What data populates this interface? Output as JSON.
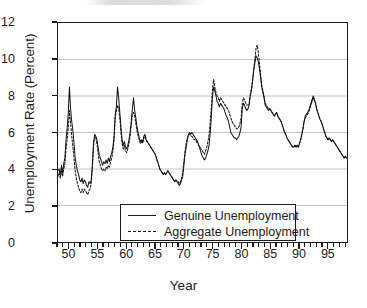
{
  "chart_data": {
    "type": "line",
    "title": "",
    "xlabel": "Year",
    "ylabel": "Unemployment Rate (Percent)",
    "xlim": [
      1948.0,
      1998.5
    ],
    "ylim": [
      0,
      12
    ],
    "yticks": [
      0,
      2,
      4,
      6,
      8,
      10,
      12
    ],
    "ytick_labels": [
      "0",
      "2",
      "4",
      "6",
      "8",
      "10",
      "12"
    ],
    "xticks": [
      1950,
      1955,
      1960,
      1965,
      1970,
      1975,
      1980,
      1985,
      1990,
      1995
    ],
    "xtick_labels": [
      "50",
      "55",
      "60",
      "65",
      "70",
      "75",
      "80",
      "85",
      "90",
      "95"
    ],
    "minor_xtick_interval": 1,
    "grid": "horizontal-major",
    "grid_color": "#b4b4b4",
    "axis_color": "#1a1a1a",
    "legend_position": "lower-center",
    "legend_entries": [
      "Genuine Unemployment",
      "Aggregate Unemployment"
    ],
    "series": [
      {
        "name": "Genuine Unemployment",
        "style": "solid",
        "color": "#111111",
        "x": [
          1948.0,
          1948.2,
          1948.4,
          1948.6,
          1948.8,
          1949.0,
          1949.2,
          1949.4,
          1949.6,
          1949.8,
          1950.0,
          1950.2,
          1950.4,
          1950.6,
          1950.8,
          1951.0,
          1951.2,
          1951.4,
          1951.6,
          1951.8,
          1952.0,
          1952.2,
          1952.4,
          1952.6,
          1952.8,
          1953.0,
          1953.2,
          1953.4,
          1953.6,
          1953.8,
          1954.0,
          1954.2,
          1954.4,
          1954.6,
          1954.8,
          1955.0,
          1955.2,
          1955.4,
          1955.6,
          1955.8,
          1956.0,
          1956.2,
          1956.4,
          1956.6,
          1956.8,
          1957.0,
          1957.2,
          1957.4,
          1957.6,
          1957.8,
          1958.0,
          1958.2,
          1958.4,
          1958.6,
          1958.8,
          1959.0,
          1959.2,
          1959.4,
          1959.6,
          1959.8,
          1960.0,
          1960.2,
          1960.4,
          1960.6,
          1960.8,
          1961.0,
          1961.2,
          1961.4,
          1961.6,
          1961.8,
          1962.0,
          1962.2,
          1962.4,
          1962.6,
          1962.8,
          1963.0,
          1963.2,
          1963.4,
          1963.6,
          1963.8,
          1964.0,
          1964.2,
          1964.4,
          1964.6,
          1964.8,
          1965.0,
          1965.2,
          1965.4,
          1965.6,
          1965.8,
          1966.0,
          1966.2,
          1966.4,
          1966.6,
          1966.8,
          1967.0,
          1967.2,
          1967.4,
          1967.6,
          1967.8,
          1968.0,
          1968.2,
          1968.4,
          1968.6,
          1968.8,
          1969.0,
          1969.2,
          1969.4,
          1969.6,
          1969.8,
          1970.0,
          1970.2,
          1970.4,
          1970.6,
          1970.8,
          1971.0,
          1971.2,
          1971.4,
          1971.6,
          1971.8,
          1972.0,
          1972.2,
          1972.4,
          1972.6,
          1972.8,
          1973.0,
          1973.2,
          1973.4,
          1973.6,
          1973.8,
          1974.0,
          1974.2,
          1974.4,
          1974.6,
          1974.8,
          1975.0,
          1975.2,
          1975.4,
          1975.6,
          1975.8,
          1976.0,
          1976.2,
          1976.4,
          1976.6,
          1976.8,
          1977.0,
          1977.2,
          1977.4,
          1977.6,
          1977.8,
          1978.0,
          1978.2,
          1978.4,
          1978.6,
          1978.8,
          1979.0,
          1979.2,
          1979.4,
          1979.6,
          1979.8,
          1980.0,
          1980.2,
          1980.4,
          1980.6,
          1980.8,
          1981.0,
          1981.2,
          1981.4,
          1981.6,
          1981.8,
          1982.0,
          1982.2,
          1982.4,
          1982.6,
          1982.8,
          1983.0,
          1983.2,
          1983.4,
          1983.6,
          1983.8,
          1984.0,
          1984.2,
          1984.4,
          1984.6,
          1984.8,
          1985.0,
          1985.2,
          1985.4,
          1985.6,
          1985.8,
          1986.0,
          1986.2,
          1986.4,
          1986.6,
          1986.8,
          1987.0,
          1987.2,
          1987.4,
          1987.6,
          1987.8,
          1988.0,
          1988.2,
          1988.4,
          1988.6,
          1988.8,
          1989.0,
          1989.2,
          1989.4,
          1989.6,
          1989.8,
          1990.0,
          1990.2,
          1990.4,
          1990.6,
          1990.8,
          1991.0,
          1991.2,
          1991.4,
          1991.6,
          1991.8,
          1992.0,
          1992.2,
          1992.4,
          1992.6,
          1992.8,
          1993.0,
          1993.2,
          1993.4,
          1993.6,
          1993.8,
          1994.0,
          1994.2,
          1994.4,
          1994.6,
          1994.8,
          1995.0,
          1995.2,
          1995.4,
          1995.6,
          1995.8,
          1996.0,
          1996.2,
          1996.4,
          1996.6,
          1996.8,
          1997.0,
          1997.2,
          1997.4,
          1997.6,
          1997.8,
          1998.0,
          1998.2,
          1998.4
        ],
        "y": [
          3.9,
          4.0,
          3.7,
          4.2,
          3.8,
          4.3,
          4.6,
          5.6,
          6.2,
          7.1,
          8.5,
          7.3,
          6.6,
          6.1,
          5.4,
          4.6,
          4.2,
          3.9,
          3.7,
          3.4,
          3.3,
          3.5,
          3.2,
          3.4,
          3.3,
          3.1,
          3.0,
          3.3,
          3.2,
          3.4,
          4.2,
          5.4,
          5.9,
          5.8,
          5.6,
          5.2,
          4.8,
          4.6,
          4.4,
          4.2,
          4.4,
          4.3,
          4.5,
          4.3,
          4.6,
          4.4,
          4.7,
          4.9,
          5.2,
          5.8,
          7.0,
          7.4,
          8.5,
          7.9,
          7.1,
          6.3,
          5.6,
          5.3,
          5.5,
          5.2,
          5.1,
          5.3,
          5.6,
          6.0,
          6.6,
          7.3,
          7.9,
          7.2,
          6.8,
          6.3,
          6.0,
          5.7,
          5.5,
          5.6,
          5.5,
          5.8,
          5.9,
          5.6,
          5.5,
          5.4,
          5.3,
          5.2,
          5.1,
          5.0,
          4.9,
          4.8,
          4.6,
          4.4,
          4.2,
          4.0,
          3.9,
          3.8,
          3.7,
          3.8,
          3.7,
          3.8,
          3.9,
          3.8,
          3.7,
          3.6,
          3.5,
          3.4,
          3.3,
          3.4,
          3.3,
          3.2,
          3.1,
          3.2,
          3.4,
          3.6,
          4.2,
          4.8,
          5.2,
          5.6,
          5.9,
          6.0,
          5.9,
          6.0,
          5.9,
          5.8,
          5.7,
          5.6,
          5.5,
          5.3,
          5.1,
          4.9,
          4.7,
          4.6,
          4.5,
          4.6,
          4.8,
          5.0,
          5.3,
          6.0,
          6.9,
          8.0,
          8.5,
          8.3,
          8.0,
          7.7,
          7.6,
          7.4,
          7.6,
          7.5,
          7.4,
          7.3,
          7.1,
          6.9,
          6.8,
          6.6,
          6.3,
          6.0,
          5.9,
          5.8,
          5.7,
          5.7,
          5.6,
          5.7,
          5.8,
          6.0,
          6.3,
          7.3,
          7.6,
          7.5,
          7.3,
          7.2,
          7.3,
          7.5,
          8.0,
          8.3,
          8.8,
          9.4,
          9.8,
          10.2,
          10.1,
          9.9,
          9.5,
          9.0,
          8.5,
          8.2,
          7.9,
          7.5,
          7.4,
          7.3,
          7.2,
          7.3,
          7.2,
          7.1,
          7.0,
          6.9,
          7.0,
          7.1,
          6.9,
          6.8,
          6.7,
          6.6,
          6.4,
          6.2,
          6.0,
          5.9,
          5.7,
          5.6,
          5.5,
          5.4,
          5.3,
          5.2,
          5.2,
          5.3,
          5.2,
          5.3,
          5.2,
          5.4,
          5.6,
          5.9,
          6.2,
          6.6,
          6.9,
          7.0,
          7.1,
          7.2,
          7.4,
          7.6,
          7.8,
          8.0,
          7.8,
          7.6,
          7.3,
          7.1,
          6.9,
          6.7,
          6.6,
          6.4,
          6.2,
          6.0,
          5.8,
          5.7,
          5.6,
          5.7,
          5.6,
          5.5,
          5.6,
          5.5,
          5.4,
          5.3,
          5.2,
          5.1,
          5.0,
          4.9,
          4.8,
          4.7,
          4.6,
          4.7,
          4.6
        ]
      },
      {
        "name": "Aggregate Unemployment",
        "style": "dashed",
        "color": "#111111",
        "x": [
          1948.0,
          1948.2,
          1948.4,
          1948.6,
          1948.8,
          1949.0,
          1949.2,
          1949.4,
          1949.6,
          1949.8,
          1950.0,
          1950.2,
          1950.4,
          1950.6,
          1950.8,
          1951.0,
          1951.2,
          1951.4,
          1951.6,
          1951.8,
          1952.0,
          1952.2,
          1952.4,
          1952.6,
          1952.8,
          1953.0,
          1953.2,
          1953.4,
          1953.6,
          1953.8,
          1954.0,
          1954.2,
          1954.4,
          1954.6,
          1954.8,
          1955.0,
          1955.2,
          1955.4,
          1955.6,
          1955.8,
          1956.0,
          1956.2,
          1956.4,
          1956.6,
          1956.8,
          1957.0,
          1957.2,
          1957.4,
          1957.6,
          1957.8,
          1958.0,
          1958.2,
          1958.4,
          1958.6,
          1958.8,
          1959.0,
          1959.2,
          1959.4,
          1959.6,
          1959.8,
          1960.0,
          1960.2,
          1960.4,
          1960.6,
          1960.8,
          1961.0,
          1961.2,
          1961.4,
          1961.6,
          1961.8,
          1962.0,
          1962.2,
          1962.4,
          1962.6,
          1962.8,
          1963.0,
          1963.2,
          1963.4,
          1963.6,
          1963.8,
          1964.0,
          1964.2,
          1964.4,
          1964.6,
          1964.8,
          1965.0,
          1965.2,
          1965.4,
          1965.6,
          1965.8,
          1966.0,
          1966.2,
          1966.4,
          1966.6,
          1966.8,
          1967.0,
          1967.2,
          1967.4,
          1967.6,
          1967.8,
          1968.0,
          1968.2,
          1968.4,
          1968.6,
          1968.8,
          1969.0,
          1969.2,
          1969.4,
          1969.6,
          1969.8,
          1970.0,
          1970.2,
          1970.4,
          1970.6,
          1970.8,
          1971.0,
          1971.2,
          1971.4,
          1971.6,
          1971.8,
          1972.0,
          1972.2,
          1972.4,
          1972.6,
          1972.8,
          1973.0,
          1973.2,
          1973.4,
          1973.6,
          1973.8,
          1974.0,
          1974.2,
          1974.4,
          1974.6,
          1974.8,
          1975.0,
          1975.2,
          1975.4,
          1975.6,
          1975.8,
          1976.0,
          1976.2,
          1976.4,
          1976.6,
          1976.8,
          1977.0,
          1977.2,
          1977.4,
          1977.6,
          1977.8,
          1978.0,
          1978.2,
          1978.4,
          1978.6,
          1978.8,
          1979.0,
          1979.2,
          1979.4,
          1979.6,
          1979.8,
          1980.0,
          1980.2,
          1980.4,
          1980.6,
          1980.8,
          1981.0,
          1981.2,
          1981.4,
          1981.6,
          1981.8,
          1982.0,
          1982.2,
          1982.4,
          1982.6,
          1982.8,
          1983.0,
          1983.2,
          1983.4,
          1983.6,
          1983.8,
          1984.0,
          1984.2,
          1984.4,
          1984.6,
          1984.8,
          1985.0,
          1985.2,
          1985.4,
          1985.6,
          1985.8,
          1986.0,
          1986.2,
          1986.4,
          1986.6,
          1986.8,
          1987.0,
          1987.2,
          1987.4,
          1987.6,
          1987.8,
          1988.0,
          1988.2,
          1988.4,
          1988.6,
          1988.8,
          1989.0,
          1989.2,
          1989.4,
          1989.6,
          1989.8,
          1990.0,
          1990.2,
          1990.4,
          1990.6,
          1990.8,
          1991.0,
          1991.2,
          1991.4,
          1991.6,
          1991.8,
          1992.0,
          1992.2,
          1992.4,
          1992.6,
          1992.8,
          1993.0,
          1993.2,
          1993.4,
          1993.6,
          1993.8,
          1994.0,
          1994.2,
          1994.4,
          1994.6,
          1994.8,
          1995.0,
          1995.2,
          1995.4,
          1995.6,
          1995.8,
          1996.0,
          1996.2,
          1996.4,
          1996.6,
          1996.8,
          1997.0,
          1997.2,
          1997.4,
          1997.6,
          1997.8,
          1998.0,
          1998.2,
          1998.4
        ],
        "y": [
          3.6,
          3.8,
          3.5,
          3.9,
          3.6,
          4.0,
          4.3,
          5.1,
          5.6,
          6.3,
          7.2,
          6.5,
          5.8,
          5.2,
          4.6,
          3.9,
          3.5,
          3.2,
          3.0,
          2.8,
          2.7,
          2.9,
          2.7,
          2.9,
          2.8,
          2.7,
          2.6,
          2.8,
          2.9,
          3.2,
          4.0,
          5.2,
          5.8,
          5.7,
          5.4,
          4.9,
          4.4,
          4.2,
          4.0,
          3.9,
          4.0,
          3.9,
          4.1,
          4.0,
          4.2,
          4.1,
          4.4,
          4.6,
          5.0,
          5.6,
          6.8,
          7.2,
          7.5,
          7.3,
          6.8,
          6.0,
          5.4,
          5.1,
          5.3,
          5.0,
          4.9,
          5.1,
          5.4,
          5.8,
          6.4,
          7.0,
          7.1,
          6.9,
          6.5,
          6.1,
          5.8,
          5.6,
          5.4,
          5.5,
          5.4,
          5.7,
          5.8,
          5.6,
          5.5,
          5.4,
          5.3,
          5.2,
          5.1,
          5.0,
          4.9,
          4.8,
          4.6,
          4.4,
          4.2,
          4.0,
          3.9,
          3.8,
          3.7,
          3.8,
          3.7,
          3.8,
          3.9,
          3.8,
          3.7,
          3.6,
          3.5,
          3.4,
          3.3,
          3.4,
          3.3,
          3.3,
          3.2,
          3.3,
          3.5,
          3.8,
          4.4,
          5.0,
          5.4,
          5.7,
          5.9,
          5.9,
          5.8,
          5.8,
          5.7,
          5.6,
          5.6,
          5.5,
          5.4,
          5.3,
          5.2,
          5.1,
          5.0,
          4.9,
          4.8,
          5.0,
          5.2,
          5.5,
          5.9,
          6.6,
          7.4,
          8.4,
          8.9,
          8.5,
          8.2,
          8.0,
          7.9,
          7.7,
          7.9,
          7.8,
          7.7,
          7.6,
          7.5,
          7.4,
          7.3,
          7.2,
          7.0,
          6.8,
          6.6,
          6.5,
          6.4,
          6.3,
          6.2,
          6.2,
          6.3,
          6.5,
          6.8,
          7.6,
          7.9,
          7.8,
          7.6,
          7.5,
          7.5,
          7.6,
          8.1,
          8.4,
          8.9,
          9.5,
          10.0,
          10.6,
          10.8,
          10.4,
          9.8,
          9.2,
          8.6,
          8.3,
          8.0,
          7.6,
          7.5,
          7.4,
          7.3,
          7.3,
          7.2,
          7.1,
          7.0,
          6.9,
          7.0,
          7.1,
          6.9,
          6.8,
          6.7,
          6.6,
          6.4,
          6.2,
          6.0,
          5.9,
          5.7,
          5.6,
          5.5,
          5.4,
          5.3,
          5.2,
          5.2,
          5.3,
          5.2,
          5.3,
          5.2,
          5.4,
          5.6,
          5.9,
          6.2,
          6.6,
          6.8,
          6.9,
          7.0,
          7.1,
          7.3,
          7.5,
          7.7,
          7.9,
          7.8,
          7.6,
          7.3,
          7.1,
          6.9,
          6.7,
          6.6,
          6.4,
          6.2,
          6.0,
          5.8,
          5.7,
          5.6,
          5.7,
          5.6,
          5.5,
          5.6,
          5.5,
          5.4,
          5.3,
          5.2,
          5.1,
          5.0,
          4.9,
          4.8,
          4.7,
          4.6,
          4.7,
          4.6
        ]
      }
    ]
  }
}
